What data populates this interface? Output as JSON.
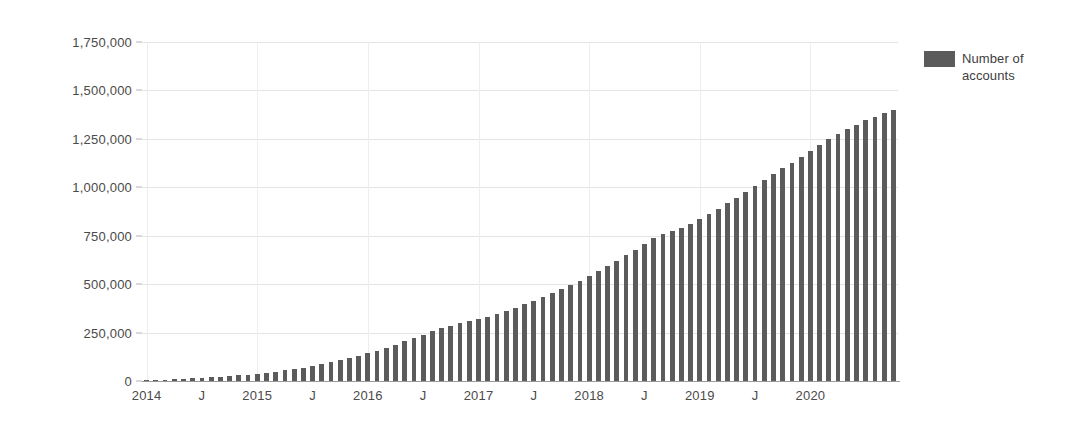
{
  "chart_data": {
    "type": "bar",
    "title": "",
    "xlabel": "",
    "ylabel": "",
    "ylim": [
      0,
      1750000
    ],
    "grid": true,
    "legend_position": "right",
    "y_ticks": [
      "0",
      "250,000",
      "500,000",
      "750,000",
      "1,000,000",
      "1,250,000",
      "1,500,000",
      "1,750,000"
    ],
    "y_tick_values": [
      0,
      250000,
      500000,
      750000,
      1000000,
      1250000,
      1500000,
      1750000
    ],
    "x_tick_labels": [
      "2014",
      "J",
      "2015",
      "J",
      "2016",
      "J",
      "2017",
      "J",
      "2018",
      "J",
      "2019",
      "J",
      "2020"
    ],
    "legend": [
      {
        "label": "Number of accounts",
        "color": "#5b5b5b"
      }
    ],
    "series": [
      {
        "name": "Number of accounts",
        "color": "#5b5b5b",
        "categories": [
          "2014-01",
          "2014-02",
          "2014-03",
          "2014-04",
          "2014-05",
          "2014-06",
          "2014-07",
          "2014-08",
          "2014-09",
          "2014-10",
          "2014-11",
          "2014-12",
          "2015-01",
          "2015-02",
          "2015-03",
          "2015-04",
          "2015-05",
          "2015-06",
          "2015-07",
          "2015-08",
          "2015-09",
          "2015-10",
          "2015-11",
          "2015-12",
          "2016-01",
          "2016-02",
          "2016-03",
          "2016-04",
          "2016-05",
          "2016-06",
          "2016-07",
          "2016-08",
          "2016-09",
          "2016-10",
          "2016-11",
          "2016-12",
          "2017-01",
          "2017-02",
          "2017-03",
          "2017-04",
          "2017-05",
          "2017-06",
          "2017-07",
          "2017-08",
          "2017-09",
          "2017-10",
          "2017-11",
          "2017-12",
          "2018-01",
          "2018-02",
          "2018-03",
          "2018-04",
          "2018-05",
          "2018-06",
          "2018-07",
          "2018-08",
          "2018-09",
          "2018-10",
          "2018-11",
          "2018-12",
          "2019-01",
          "2019-02",
          "2019-03",
          "2019-04",
          "2019-05",
          "2019-06",
          "2019-07",
          "2019-08",
          "2019-09",
          "2019-10",
          "2019-11",
          "2019-12",
          "2020-01",
          "2020-02",
          "2020-03",
          "2020-04",
          "2020-05",
          "2020-06",
          "2020-07",
          "2020-08",
          "2020-09",
          "2020-10"
        ],
        "values": [
          3000,
          5000,
          7000,
          9000,
          11000,
          13000,
          16000,
          19000,
          22000,
          25000,
          29000,
          33000,
          38000,
          43000,
          49000,
          55000,
          62000,
          69000,
          77000,
          86000,
          96000,
          107000,
          118000,
          130000,
          143000,
          157000,
          172000,
          188000,
          205000,
          222000,
          240000,
          258000,
          272000,
          285000,
          297000,
          308000,
          320000,
          333000,
          347000,
          362000,
          378000,
          395000,
          413000,
          432000,
          452000,
          473000,
          495000,
          518000,
          542000,
          567000,
          593000,
          620000,
          648000,
          677000,
          707000,
          738000,
          757000,
          773000,
          790000,
          810000,
          835000,
          862000,
          890000,
          918000,
          947000,
          977000,
          1007000,
          1038000,
          1068000,
          1098000,
          1128000,
          1158000,
          1188000,
          1218000,
          1248000,
          1275000,
          1300000,
          1322000,
          1345000,
          1365000,
          1385000,
          1400000
        ]
      }
    ]
  },
  "axis": {
    "x_ticks": [
      {
        "label": "2014",
        "index": 0
      },
      {
        "label": "J",
        "index": 6
      },
      {
        "label": "2015",
        "index": 12
      },
      {
        "label": "J",
        "index": 18
      },
      {
        "label": "2016",
        "index": 24
      },
      {
        "label": "J",
        "index": 30
      },
      {
        "label": "2017",
        "index": 36
      },
      {
        "label": "J",
        "index": 42
      },
      {
        "label": "2018",
        "index": 48
      },
      {
        "label": "J",
        "index": 54
      },
      {
        "label": "2019",
        "index": 60
      },
      {
        "label": "J",
        "index": 66
      },
      {
        "label": "2020",
        "index": 72
      }
    ]
  },
  "colors": {
    "bar": "#5b5b5b",
    "gridline": "#e4e4e4",
    "axis": "#9a9a9a",
    "text": "#4a4a4a",
    "background": "#ffffff"
  }
}
